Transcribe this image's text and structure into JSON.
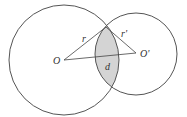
{
  "diagram": {
    "labels": {
      "center_left": "O",
      "center_right": "O'",
      "radius_left": "r",
      "radius_right": "r'",
      "distance": "d"
    },
    "circles": [
      {
        "name": "circle-O",
        "cx": 64,
        "cy": 60,
        "r": 55
      },
      {
        "name": "circle-O-prime",
        "cx": 136,
        "cy": 54,
        "r": 41
      }
    ],
    "colors": {
      "stroke": "#555555",
      "lens_fill": "#d4d4d4",
      "background": "#ffffff"
    }
  }
}
